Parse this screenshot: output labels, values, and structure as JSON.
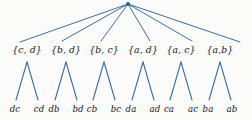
{
  "diagram": {
    "background_color": "#fbfbfa",
    "edge_color": "#3b6ea5",
    "node_dot_color": "#2c5b96",
    "text_color": "#16181c",
    "root": {
      "label": "",
      "x": 128,
      "y": 4
    },
    "sets": [
      {
        "label": "{c, d}",
        "x": 27,
        "y": 50,
        "apex_x": 27,
        "apex_y": 62
      },
      {
        "label": "{b, d}",
        "x": 66,
        "y": 50,
        "apex_x": 66,
        "apex_y": 62
      },
      {
        "label": "{b, c}",
        "x": 104,
        "y": 50,
        "apex_x": 104,
        "apex_y": 62
      },
      {
        "label": "{a, d}",
        "x": 143,
        "y": 50,
        "apex_x": 143,
        "apex_y": 62
      },
      {
        "label": "{a, c}",
        "x": 181,
        "y": 50,
        "apex_x": 181,
        "apex_y": 62
      },
      {
        "label": "{a,b}",
        "x": 220,
        "y": 50,
        "apex_x": 220,
        "apex_y": 62
      }
    ],
    "leaves": [
      {
        "label": "dc",
        "x": 15,
        "y": 109,
        "parent": 0,
        "tip_x": 16,
        "tip_y": 100
      },
      {
        "label": "cd",
        "x": 39,
        "y": 109,
        "parent": 0,
        "tip_x": 38,
        "tip_y": 100
      },
      {
        "label": "db",
        "x": 54,
        "y": 109,
        "parent": 1,
        "tip_x": 55,
        "tip_y": 100
      },
      {
        "label": "bd",
        "x": 78,
        "y": 109,
        "parent": 1,
        "tip_x": 77,
        "tip_y": 100
      },
      {
        "label": "cb",
        "x": 92,
        "y": 109,
        "parent": 2,
        "tip_x": 93,
        "tip_y": 100
      },
      {
        "label": "bc",
        "x": 116,
        "y": 109,
        "parent": 2,
        "tip_x": 115,
        "tip_y": 100
      },
      {
        "label": "da",
        "x": 131,
        "y": 109,
        "parent": 3,
        "tip_x": 132,
        "tip_y": 100
      },
      {
        "label": "ad",
        "x": 155,
        "y": 109,
        "parent": 3,
        "tip_x": 154,
        "tip_y": 100
      },
      {
        "label": "ca",
        "x": 169,
        "y": 109,
        "parent": 4,
        "tip_x": 170,
        "tip_y": 100
      },
      {
        "label": "ac",
        "x": 193,
        "y": 109,
        "parent": 4,
        "tip_x": 192,
        "tip_y": 100
      },
      {
        "label": "ba",
        "x": 208,
        "y": 109,
        "parent": 5,
        "tip_x": 209,
        "tip_y": 100
      },
      {
        "label": "ab",
        "x": 232,
        "y": 109,
        "parent": 5,
        "tip_x": 231,
        "tip_y": 100
      }
    ],
    "root_edge_endpoints": [
      {
        "x": 20,
        "y": 42
      },
      {
        "x": 62,
        "y": 41
      },
      {
        "x": 101,
        "y": 41
      },
      {
        "x": 150,
        "y": 41
      },
      {
        "x": 192,
        "y": 41
      },
      {
        "x": 240,
        "y": 42
      }
    ]
  }
}
